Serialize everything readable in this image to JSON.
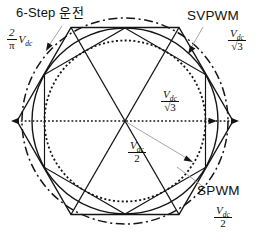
{
  "figure": {
    "background": "#ffffff",
    "line_color": "#151515",
    "leader_color": "#9b9b9b",
    "labels": {
      "six_step": "6-Step 운전",
      "svpwm": "SVPWM",
      "spwm": "SPWM"
    },
    "values": {
      "six_step_radius": {
        "num": "2",
        "den": "π",
        "side": "V",
        "side_sub": "dc"
      },
      "svpwm_radius_top": {
        "num": "V",
        "num_sub": "dc",
        "den": "√3"
      },
      "svpwm_radius_axis": {
        "num": "V",
        "num_sub": "dc",
        "den": "√3"
      },
      "spwm_radius_mid": {
        "num": "V",
        "num_sub": "dc",
        "den": "2"
      },
      "spwm_radius_bottom": {
        "num": "V",
        "num_sub": "dc",
        "den": "2"
      }
    }
  }
}
